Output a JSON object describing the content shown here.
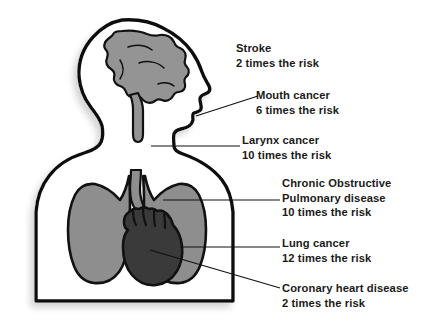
{
  "diagram": {
    "colors": {
      "outline": "#111111",
      "brain": "#949494",
      "lung": "#8e8e8e",
      "heart": "#3a3a3a",
      "text": "#1a1a1a",
      "background": "#ffffff",
      "leader_line": "#111111",
      "shadow": "#b8b8b8"
    },
    "body_parts": [
      {
        "name": "head-profile",
        "fill": "#ffffff"
      },
      {
        "name": "brain",
        "fill": "#949494"
      },
      {
        "name": "brainstem",
        "fill": "#949494"
      },
      {
        "name": "torso",
        "fill": "#ffffff"
      },
      {
        "name": "trachea",
        "fill": "#8e8e8e"
      },
      {
        "name": "left-lung",
        "fill": "#8e8e8e"
      },
      {
        "name": "right-lung",
        "fill": "#8e8e8e"
      },
      {
        "name": "heart",
        "fill": "#3a3a3a"
      }
    ],
    "labels": [
      {
        "id": "stroke",
        "condition": "Stroke",
        "risk": "2 times the risk",
        "multiplier": 2,
        "organ": "brain",
        "leader_line": false
      },
      {
        "id": "mouth-cancer",
        "condition": "Mouth cancer",
        "risk": "6 times the risk",
        "multiplier": 6,
        "organ": "mouth",
        "leader_line": true
      },
      {
        "id": "larynx-cancer",
        "condition": "Larynx cancer",
        "risk": "10 times the risk",
        "multiplier": 10,
        "organ": "larynx",
        "leader_line": true
      },
      {
        "id": "copd",
        "condition_line1": "Chronic Obstructive",
        "condition_line2": "Pulmonary disease",
        "risk": "10 times the risk",
        "multiplier": 10,
        "organ": "lungs",
        "leader_line": true
      },
      {
        "id": "lung-cancer",
        "condition": "Lung cancer",
        "risk": "12 times the risk",
        "multiplier": 12,
        "organ": "lungs",
        "leader_line": true
      },
      {
        "id": "coronary-heart-disease",
        "condition": "Coronary heart disease",
        "risk": "2 times the risk",
        "multiplier": 2,
        "organ": "heart",
        "leader_line": true
      }
    ]
  }
}
